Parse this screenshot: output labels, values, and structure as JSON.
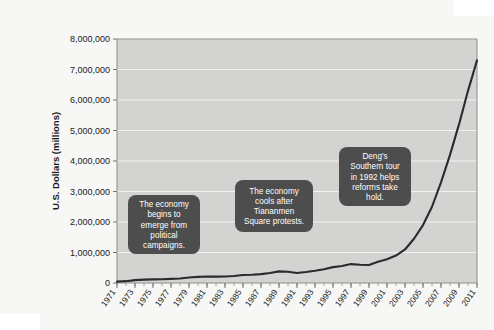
{
  "chart_data": {
    "type": "line",
    "title": "",
    "subtitle": "",
    "xlabel": "",
    "ylabel": "U.S. Dollars (millions)",
    "xlim": [
      1971,
      2011
    ],
    "ylim": [
      0,
      8000000
    ],
    "ytick_step": 1000000,
    "grid": true,
    "legend": "none",
    "plot_background_color": "#d3d3d1",
    "line_color": "#2b2b2b",
    "gridline_color": "#f2f2f0",
    "callout_color": "#4d4d4d",
    "y_tick_labels": [
      "0",
      "1,000,000",
      "2,000,000",
      "3,000,000",
      "4,000,000",
      "5,000,000",
      "6,000,000",
      "7,000,000",
      "8,000,000"
    ],
    "y_tick_values": [
      0,
      1000000,
      2000000,
      3000000,
      4000000,
      5000000,
      6000000,
      7000000,
      8000000
    ],
    "x_tick_labels": [
      "1971",
      "1973",
      "1975",
      "1977",
      "1979",
      "1981",
      "1983",
      "1985",
      "1987",
      "1989",
      "1991",
      "1993",
      "1995",
      "1997",
      "1999",
      "2001",
      "2003",
      "2005",
      "2007",
      "2009",
      "2011"
    ],
    "x_minor_ticks_every_years": 1,
    "x": [
      1971,
      1972,
      1973,
      1974,
      1975,
      1976,
      1977,
      1978,
      1979,
      1980,
      1981,
      1982,
      1983,
      1984,
      1985,
      1986,
      1987,
      1988,
      1989,
      1990,
      1991,
      1992,
      1993,
      1994,
      1995,
      1996,
      1997,
      1998,
      1999,
      2000,
      2001,
      2002,
      2003,
      2004,
      2005,
      2006,
      2007,
      2008,
      2009,
      2010,
      2011
    ],
    "values": [
      45000,
      60000,
      95000,
      110000,
      120000,
      125000,
      135000,
      150000,
      180000,
      200000,
      215000,
      210000,
      215000,
      230000,
      260000,
      270000,
      290000,
      330000,
      380000,
      370000,
      330000,
      360000,
      400000,
      450000,
      520000,
      560000,
      620000,
      600000,
      590000,
      700000,
      780000,
      900000,
      1100000,
      1450000,
      1900000,
      2500000,
      3300000,
      4200000,
      5200000,
      6300000,
      7300000
    ],
    "annotations": [
      {
        "id": "annotation-political-campaigns",
        "lines": [
          "The economy",
          "begins to",
          "emerge from",
          "political",
          "campaigns."
        ],
        "x_left": 88,
        "y_top": 179,
        "width": 72,
        "height": 59
      },
      {
        "id": "annotation-tiananmen",
        "lines": [
          "The economy",
          "cools after",
          "Tiananmen",
          "Square protests."
        ],
        "x_left": 195,
        "y_top": 164,
        "width": 78,
        "height": 52
      },
      {
        "id": "annotation-deng-southern-tour",
        "lines": [
          "Deng's",
          "Southern tour",
          "in 1992 helps",
          "reforms take",
          "hold."
        ],
        "x_left": 299,
        "y_top": 131,
        "width": 72,
        "height": 59
      }
    ]
  }
}
